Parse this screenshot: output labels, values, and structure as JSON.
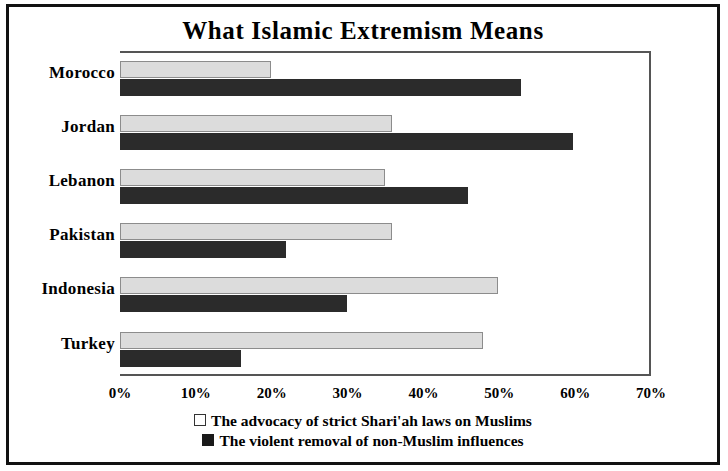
{
  "chart_data": {
    "type": "bar",
    "orientation": "horizontal",
    "title": "What Islamic Extremism Means",
    "xlabel": "",
    "ylabel": "",
    "xlim": [
      0,
      70
    ],
    "xtick_step": 10,
    "xticks": [
      "0%",
      "10%",
      "20%",
      "30%",
      "40%",
      "50%",
      "60%",
      "70%"
    ],
    "grid": false,
    "legend_position": "bottom",
    "categories": [
      "Morocco",
      "Jordan",
      "Lebanon",
      "Pakistan",
      "Indonesia",
      "Turkey"
    ],
    "series": [
      {
        "name": "The advocacy of strict Shari'ah laws on Muslims",
        "swatch": "light",
        "color": "#dcdcdc",
        "values": [
          20,
          36,
          35,
          36,
          50,
          48
        ]
      },
      {
        "name": "The violent removal of non-Muslim influences",
        "swatch": "dark",
        "color": "#2b2b2b",
        "values": [
          53,
          60,
          46,
          22,
          30,
          16
        ]
      }
    ]
  }
}
